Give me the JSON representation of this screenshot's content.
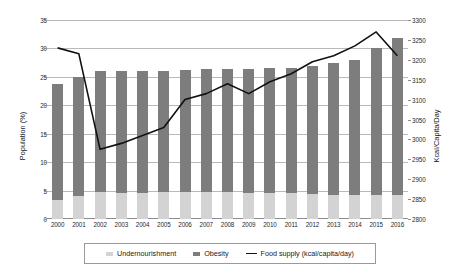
{
  "chart_data": {
    "type": "bar",
    "title": "",
    "subtitle": "",
    "xlabel": "",
    "ylabel": "Population (%)",
    "y2label": "Kcal/Capita/Day",
    "grid": true,
    "legend_position": "bottom",
    "ylim": [
      0,
      35
    ],
    "ytick_step": 5,
    "y2lim": [
      2800,
      3300
    ],
    "y2tick_step": 50,
    "yticks": [
      "0",
      "5",
      "10",
      "15",
      "20",
      "25",
      "30",
      "35"
    ],
    "y2ticks": [
      "2800",
      "2850",
      "2900",
      "2950",
      "3000",
      "3050",
      "3100",
      "3150",
      "3200",
      "3250",
      "3300"
    ],
    "categories": [
      "2000",
      "2001",
      "2002",
      "2003",
      "2004",
      "2005",
      "2006",
      "2007",
      "2008",
      "2009",
      "2010",
      "2011",
      "2012",
      "2013",
      "2014",
      "2015",
      "2016"
    ],
    "stacked": true,
    "series": [
      {
        "name": "Undernourishment",
        "axis": "left",
        "type": "bar",
        "color": "#d3d3d3",
        "values": [
          3.3,
          4.0,
          4.7,
          4.6,
          4.6,
          4.7,
          4.8,
          4.7,
          4.7,
          4.6,
          4.6,
          4.5,
          4.4,
          4.3,
          4.3,
          4.2,
          4.2
        ]
      },
      {
        "name": "Obesity",
        "axis": "left",
        "type": "bar",
        "color": "#7d7d7d",
        "values": [
          23.7,
          25.0,
          26.0,
          26.0,
          26.0,
          26.0,
          26.2,
          26.4,
          26.4,
          26.3,
          26.5,
          26.5,
          27.0,
          27.5,
          28.0,
          30.0,
          31.8
        ]
      },
      {
        "name": "Food supply (kcal/capita/day)",
        "axis": "right",
        "type": "line",
        "color": "#111111",
        "values": [
          3230,
          3215,
          2975,
          2990,
          3010,
          3030,
          3100,
          3115,
          3140,
          3115,
          3145,
          3165,
          3195,
          3210,
          3235,
          3270,
          3210
        ]
      }
    ],
    "legend": [
      {
        "label": "Undernourishment",
        "swatch": "bar",
        "color": "#d3d3d3"
      },
      {
        "label": "Obesity",
        "swatch": "bar",
        "color": "#7d7d7d"
      },
      {
        "label": "Food supply (kcal/capita/day)",
        "swatch": "line",
        "color": "#111111"
      }
    ]
  }
}
